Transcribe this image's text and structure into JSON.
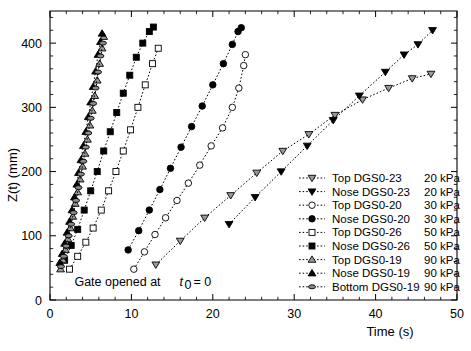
{
  "chart_data": {
    "type": "scatter",
    "title": "",
    "xlabel": "Time (s)",
    "ylabel": "Z(t) (mm)",
    "xlim": [
      0,
      50
    ],
    "ylim": [
      0,
      450
    ],
    "xticks": [
      0,
      10,
      20,
      30,
      40,
      50
    ],
    "yticks": [
      0,
      100,
      200,
      300,
      400
    ],
    "xtick_labels": [
      "0",
      "10",
      "20",
      "30",
      "40",
      "50"
    ],
    "ytick_labels": [
      "0",
      "100",
      "200",
      "300",
      "400"
    ],
    "x_minor_interval": 2,
    "y_minor_interval": 20,
    "grid": false,
    "legend_position": "right-inside-lower",
    "annotation": {
      "text_main": "Gate opened at",
      "text_var": "t",
      "text_sub": "0",
      "text_eq": "= 0",
      "x": 3.0,
      "y": 22
    },
    "series": [
      {
        "name": "Top DGS0-23   20 kPa",
        "label_part1": "Top DGS0-23",
        "label_part2": "20 kPa",
        "marker": "triangle-down",
        "fill": "#9a9a9a",
        "stroke": "#000000",
        "marker_size": 6.5,
        "points": [
          [
            13.0,
            55
          ],
          [
            16.0,
            92
          ],
          [
            19.0,
            128
          ],
          [
            22.2,
            163
          ],
          [
            25.4,
            198
          ],
          [
            28.6,
            232
          ],
          [
            31.8,
            258
          ],
          [
            35.0,
            288
          ],
          [
            38.4,
            312
          ],
          [
            41.6,
            330
          ],
          [
            44.5,
            345
          ],
          [
            46.8,
            352
          ]
        ]
      },
      {
        "name": "Nose DGS0-23   20 kPa",
        "label_part1": "Nose DGS0-23",
        "label_part2": "20 kPa",
        "marker": "triangle-down",
        "fill": "#000000",
        "stroke": "#000000",
        "marker_size": 6.5,
        "points": [
          [
            22.0,
            118
          ],
          [
            25.2,
            160
          ],
          [
            28.4,
            200
          ],
          [
            31.6,
            240
          ],
          [
            34.8,
            280
          ],
          [
            38.0,
            318
          ],
          [
            41.2,
            355
          ],
          [
            43.5,
            382
          ],
          [
            45.2,
            398
          ],
          [
            47.0,
            420
          ]
        ]
      },
      {
        "name": "Top DGS0-20   30 kPa",
        "label_part1": "Top DGS0-20",
        "label_part2": "30 kPa",
        "marker": "circle",
        "fill": "#ffffff",
        "stroke": "#000000",
        "marker_size": 6.5,
        "points": [
          [
            10.3,
            48
          ],
          [
            11.6,
            75
          ],
          [
            12.9,
            102
          ],
          [
            14.2,
            128
          ],
          [
            15.6,
            155
          ],
          [
            17.0,
            182
          ],
          [
            18.4,
            210
          ],
          [
            19.8,
            240
          ],
          [
            21.2,
            268
          ],
          [
            22.4,
            300
          ],
          [
            23.2,
            330
          ],
          [
            23.8,
            365
          ],
          [
            24.0,
            382
          ]
        ]
      },
      {
        "name": "Nose DGS0-20   30 kPa",
        "label_part1": "Nose DGS0-20",
        "label_part2": "30 kPa",
        "marker": "circle",
        "fill": "#000000",
        "stroke": "#000000",
        "marker_size": 6.5,
        "points": [
          [
            9.6,
            78
          ],
          [
            10.9,
            108
          ],
          [
            12.2,
            140
          ],
          [
            13.5,
            172
          ],
          [
            14.8,
            205
          ],
          [
            16.1,
            238
          ],
          [
            17.4,
            270
          ],
          [
            18.7,
            302
          ],
          [
            20.0,
            335
          ],
          [
            21.3,
            368
          ],
          [
            22.4,
            398
          ],
          [
            23.1,
            418
          ],
          [
            23.5,
            424
          ]
        ]
      },
      {
        "name": "Top DGS0-26   50 kPa",
        "label_part1": "Top DGS0-26",
        "label_part2": "50 kPa",
        "marker": "square",
        "fill": "#ffffff",
        "stroke": "#000000",
        "marker_size": 6.0,
        "points": [
          [
            2.4,
            48
          ],
          [
            3.4,
            68
          ],
          [
            4.4,
            90
          ],
          [
            5.3,
            112
          ],
          [
            6.3,
            140
          ],
          [
            7.2,
            170
          ],
          [
            8.1,
            200
          ],
          [
            9.0,
            232
          ],
          [
            9.9,
            265
          ],
          [
            10.8,
            300
          ],
          [
            11.7,
            335
          ],
          [
            12.6,
            368
          ],
          [
            13.3,
            392
          ]
        ]
      },
      {
        "name": "Nose DGS0-26   50 kPa",
        "label_part1": "Nose DGS0-26",
        "label_part2": "50 kPa",
        "marker": "square",
        "fill": "#000000",
        "stroke": "#000000",
        "marker_size": 6.0,
        "points": [
          [
            1.8,
            62
          ],
          [
            2.6,
            85
          ],
          [
            3.4,
            110
          ],
          [
            4.2,
            140
          ],
          [
            5.0,
            170
          ],
          [
            5.8,
            200
          ],
          [
            6.6,
            232
          ],
          [
            7.4,
            262
          ],
          [
            8.2,
            292
          ],
          [
            9.0,
            322
          ],
          [
            9.8,
            350
          ],
          [
            10.6,
            378
          ],
          [
            11.4,
            400
          ],
          [
            12.2,
            418
          ],
          [
            12.7,
            425
          ]
        ]
      },
      {
        "name": "Top DGS0-19   90 kPa",
        "label_part1": "Top DGS0-19",
        "label_part2": "90 kPa",
        "marker": "triangle-up",
        "fill": "#9a9a9a",
        "stroke": "#000000",
        "marker_size": 6.5,
        "points": [
          [
            1.3,
            48
          ],
          [
            1.6,
            62
          ],
          [
            1.9,
            78
          ],
          [
            2.2,
            95
          ],
          [
            2.5,
            112
          ],
          [
            2.8,
            130
          ],
          [
            3.1,
            150
          ],
          [
            3.4,
            168
          ],
          [
            3.7,
            188
          ],
          [
            4.0,
            208
          ],
          [
            4.3,
            228
          ],
          [
            4.6,
            250
          ],
          [
            4.9,
            272
          ],
          [
            5.2,
            295
          ],
          [
            5.5,
            318
          ],
          [
            5.8,
            342
          ],
          [
            6.1,
            368
          ],
          [
            6.4,
            392
          ],
          [
            6.6,
            410
          ]
        ]
      },
      {
        "name": "Nose DGS0-19   90 kPa",
        "label_part1": "Nose DGS0-19",
        "label_part2": "90 kPa",
        "marker": "triangle-up",
        "fill": "#000000",
        "stroke": "#000000",
        "marker_size": 6.5,
        "points": [
          [
            1.2,
            58
          ],
          [
            1.5,
            72
          ],
          [
            1.8,
            88
          ],
          [
            2.1,
            105
          ],
          [
            2.4,
            122
          ],
          [
            2.7,
            140
          ],
          [
            3.0,
            160
          ],
          [
            3.3,
            180
          ],
          [
            3.5,
            198
          ],
          [
            3.8,
            218
          ],
          [
            4.1,
            240
          ],
          [
            4.4,
            262
          ],
          [
            4.7,
            285
          ],
          [
            5.0,
            308
          ],
          [
            5.3,
            332
          ],
          [
            5.6,
            356
          ],
          [
            5.9,
            382
          ],
          [
            6.2,
            402
          ],
          [
            6.4,
            415
          ]
        ]
      },
      {
        "name": "Bottom DGS0-19   90 kPa",
        "label_part1": "Bottom DGS0-19",
        "label_part2": "90 kPa",
        "marker": "ellipse",
        "fill": "#8a8a8a",
        "stroke": "#000000",
        "marker_size": 5.0,
        "points": [
          [
            1.35,
            52
          ],
          [
            1.7,
            68
          ],
          [
            2.0,
            84
          ],
          [
            2.3,
            100
          ],
          [
            2.6,
            118
          ],
          [
            2.9,
            136
          ],
          [
            3.2,
            155
          ],
          [
            3.5,
            175
          ],
          [
            3.8,
            196
          ],
          [
            4.1,
            216
          ],
          [
            4.4,
            238
          ],
          [
            4.7,
            260
          ],
          [
            5.0,
            283
          ],
          [
            5.3,
            306
          ],
          [
            5.6,
            330
          ],
          [
            5.9,
            355
          ],
          [
            6.2,
            380
          ],
          [
            6.5,
            400
          ]
        ]
      }
    ],
    "legend_order": [
      0,
      1,
      2,
      3,
      4,
      5,
      6,
      7,
      8
    ]
  },
  "colors": {
    "axis": "#000000",
    "background": "#ffffff",
    "marker_gray": "#9a9a9a"
  }
}
